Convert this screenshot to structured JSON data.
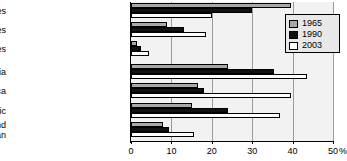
{
  "chart_data": {
    "type": "bar",
    "orientation": "horizontal",
    "title": "",
    "subtitle": "",
    "xlabel": "%",
    "ylabel": "",
    "xlim": [
      0,
      50
    ],
    "xticks": [
      0,
      10,
      20,
      30,
      40,
      50
    ],
    "xtick_labels": [
      "0",
      "10",
      "20",
      "30",
      "40",
      "50"
    ],
    "grid": true,
    "legend_position": "top-right",
    "categories": [
      "Low income countries",
      "Middle income countries",
      "High income countries",
      "South Asia",
      "Sub-Saharan Africa",
      "East Asia and Pacific",
      "Latin America and the Caribbean"
    ],
    "series": [
      {
        "name": "1965",
        "color": "#a8a8a8",
        "values": [
          39.5,
          9.0,
          1.5,
          24.0,
          16.5,
          15.0,
          8.0
        ]
      },
      {
        "name": "1990",
        "color": "#111111",
        "values": [
          30.0,
          13.0,
          2.5,
          35.5,
          18.0,
          24.0,
          9.5
        ]
      },
      {
        "name": "2003",
        "color": "#ffffff",
        "values": [
          20.0,
          18.5,
          4.5,
          43.5,
          39.5,
          37.0,
          15.5
        ]
      }
    ]
  },
  "legend": {
    "items": [
      {
        "label": "1965",
        "swatch": "#a8a8a8"
      },
      {
        "label": "1990",
        "swatch": "#111111"
      },
      {
        "label": "2003",
        "swatch": "#ffffff"
      }
    ]
  },
  "axis": {
    "x_unit_label": "%",
    "tick_labels": [
      "0",
      "10",
      "20",
      "30",
      "40",
      "50"
    ]
  },
  "category_labels": [
    {
      "lines": [
        "Low income countries"
      ]
    },
    {
      "lines": [
        "Middle income countries"
      ]
    },
    {
      "lines": [
        "High income countries"
      ]
    },
    {
      "lines": [
        "South Asia"
      ]
    },
    {
      "lines": [
        "Sub-Saharan Africa"
      ]
    },
    {
      "lines": [
        "East Asia and Pacific"
      ]
    },
    {
      "lines": [
        "Latin America and",
        "the Caribbean"
      ]
    }
  ]
}
